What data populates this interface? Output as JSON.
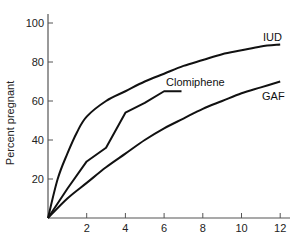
{
  "chart_data": {
    "type": "line",
    "title": "",
    "xlabel": "",
    "ylabel": "Percent pregnant",
    "xlim": [
      0,
      12.5
    ],
    "ylim": [
      0,
      105
    ],
    "grid": false,
    "legend": "inline labels at line ends",
    "x_ticks": [
      2,
      4,
      6,
      8,
      10,
      12
    ],
    "y_ticks": [
      20,
      40,
      60,
      80,
      100
    ],
    "series": [
      {
        "name": "IUD",
        "x": [
          0,
          0.5,
          1,
          1.5,
          2,
          3,
          4,
          5,
          6,
          7,
          8,
          9,
          10,
          11,
          12
        ],
        "values": [
          0,
          20,
          33,
          44,
          52,
          60,
          65,
          70,
          74,
          78,
          81,
          84,
          86,
          88,
          89
        ]
      },
      {
        "name": "Clomiphene",
        "x": [
          0,
          1,
          2,
          3,
          4,
          5,
          6,
          6.9
        ],
        "values": [
          0,
          15,
          29,
          36,
          54,
          59,
          65,
          65
        ]
      },
      {
        "name": "GAF",
        "x": [
          0,
          1,
          2,
          3,
          4,
          5,
          6,
          7,
          8,
          9,
          10,
          11,
          12
        ],
        "values": [
          0,
          10,
          18,
          26,
          33,
          40,
          46,
          51,
          56,
          60,
          64,
          67,
          70
        ]
      }
    ]
  },
  "axis": {
    "y_tick_labels": [
      "20",
      "40",
      "60",
      "80",
      "100"
    ],
    "x_tick_labels": [
      "2",
      "4",
      "6",
      "8",
      "10",
      "12"
    ]
  },
  "labels": {
    "ylabel": "Percent pregnant",
    "iud": "IUD",
    "clomiphene": "Clomiphene",
    "gaf": "GAF"
  },
  "colors": {
    "line": "#111111",
    "axis": "#555555"
  }
}
